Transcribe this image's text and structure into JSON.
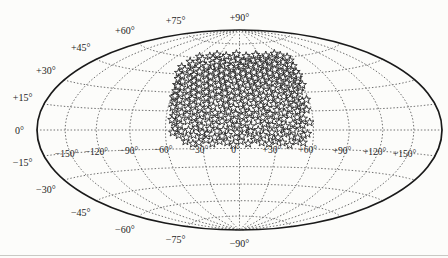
{
  "figure": {
    "background": "#fcfcfa",
    "bottom_rule_color": "#c9c9c4"
  },
  "chart_data": {
    "type": "scatter",
    "projection": "hammer-aitoff",
    "title": "",
    "xlabel": "",
    "ylabel": "",
    "lon_range_deg": [
      -180,
      180
    ],
    "lat_range_deg": [
      -90,
      90
    ],
    "grid": {
      "style": "dotted",
      "color": "#6f6f6f",
      "meridians_deg": [
        -150,
        -120,
        -90,
        -60,
        -30,
        0,
        30,
        60,
        90,
        120,
        150
      ],
      "parallels_deg": [
        -75,
        -60,
        -45,
        -30,
        -15,
        0,
        15,
        30,
        45,
        60,
        75
      ]
    },
    "outline": {
      "color": "#1a1a1a",
      "width": 1.7
    },
    "marker": {
      "shape": "open-star",
      "size_px": 9,
      "fill": "#ffffff",
      "stroke": "#1f1f1f"
    },
    "labels": {
      "latitude": [
        {
          "lat": 90,
          "text": "+90°"
        },
        {
          "lat": 75,
          "text": "+75°"
        },
        {
          "lat": 60,
          "text": "+60°"
        },
        {
          "lat": 45,
          "text": "+45°"
        },
        {
          "lat": 30,
          "text": "+30°"
        },
        {
          "lat": 15,
          "text": "+15°"
        },
        {
          "lat": 0,
          "text": "0°"
        },
        {
          "lat": -15,
          "text": "−15°"
        },
        {
          "lat": -30,
          "text": "−30°"
        },
        {
          "lat": -45,
          "text": "−45°"
        },
        {
          "lat": -60,
          "text": "−60°"
        },
        {
          "lat": -75,
          "text": "−75°"
        },
        {
          "lat": -90,
          "text": "−90°"
        }
      ],
      "longitude": [
        {
          "lon": -150,
          "text": "−150°"
        },
        {
          "lon": -120,
          "text": "−120°"
        },
        {
          "lon": -90,
          "text": "−90°"
        },
        {
          "lon": -60,
          "text": "−60°"
        },
        {
          "lon": -30,
          "text": "−30°"
        },
        {
          "lon": 0,
          "text": "0°"
        },
        {
          "lon": 30,
          "text": "+30°"
        },
        {
          "lon": 60,
          "text": "+60°"
        },
        {
          "lon": 90,
          "text": "+90°"
        },
        {
          "lon": 120,
          "text": "+120°"
        },
        {
          "lon": 150,
          "text": "+150°"
        }
      ]
    },
    "points_lon_lat_deg": [
      [
        -44,
        -9
      ],
      [
        -38,
        -11
      ],
      [
        -33,
        -10
      ],
      [
        -27,
        -8
      ],
      [
        -22,
        -11
      ],
      [
        -16,
        -9
      ],
      [
        -10,
        -10
      ],
      [
        -5,
        -12
      ],
      [
        1,
        -9
      ],
      [
        7,
        -11
      ],
      [
        12,
        -8
      ],
      [
        18,
        -10
      ],
      [
        24,
        -11
      ],
      [
        29,
        -9
      ],
      [
        35,
        -10
      ],
      [
        41,
        -12
      ],
      [
        46,
        -9
      ],
      [
        52,
        -10
      ],
      [
        -49,
        -4
      ],
      [
        -43,
        -6
      ],
      [
        -37,
        -4
      ],
      [
        -31,
        -5
      ],
      [
        -26,
        -3
      ],
      [
        -20,
        -6
      ],
      [
        -14,
        -5
      ],
      [
        -9,
        -4
      ],
      [
        -3,
        -6
      ],
      [
        2,
        -5
      ],
      [
        8,
        -3
      ],
      [
        14,
        -6
      ],
      [
        19,
        -4
      ],
      [
        25,
        -5
      ],
      [
        31,
        -6
      ],
      [
        36,
        -3
      ],
      [
        42,
        -5
      ],
      [
        47,
        -6
      ],
      [
        52,
        -4
      ],
      [
        -52,
        1
      ],
      [
        -47,
        -1
      ],
      [
        -41,
        0
      ],
      [
        -35,
        2
      ],
      [
        -30,
        -2
      ],
      [
        -24,
        1
      ],
      [
        -18,
        -1
      ],
      [
        -13,
        0
      ],
      [
        -7,
        2
      ],
      [
        -2,
        -2
      ],
      [
        4,
        1
      ],
      [
        9,
        -1
      ],
      [
        15,
        0
      ],
      [
        21,
        2
      ],
      [
        26,
        -2
      ],
      [
        32,
        1
      ],
      [
        38,
        -1
      ],
      [
        43,
        0
      ],
      [
        49,
        1
      ],
      [
        -53,
        6
      ],
      [
        -48,
        4
      ],
      [
        -42,
        7
      ],
      [
        -36,
        5
      ],
      [
        -31,
        3
      ],
      [
        -25,
        6
      ],
      [
        -19,
        4
      ],
      [
        -14,
        7
      ],
      [
        -8,
        5
      ],
      [
        -2,
        4
      ],
      [
        3,
        6
      ],
      [
        9,
        3
      ],
      [
        15,
        7
      ],
      [
        20,
        5
      ],
      [
        26,
        4
      ],
      [
        32,
        6
      ],
      [
        37,
        3
      ],
      [
        43,
        5
      ],
      [
        48,
        7
      ],
      [
        51,
        4
      ],
      [
        -54,
        11
      ],
      [
        -49,
        9
      ],
      [
        -43,
        12
      ],
      [
        -37,
        10
      ],
      [
        -32,
        8
      ],
      [
        -26,
        11
      ],
      [
        -20,
        9
      ],
      [
        -15,
        12
      ],
      [
        -9,
        10
      ],
      [
        -4,
        8
      ],
      [
        2,
        11
      ],
      [
        8,
        9
      ],
      [
        13,
        12
      ],
      [
        19,
        10
      ],
      [
        25,
        8
      ],
      [
        30,
        11
      ],
      [
        36,
        9
      ],
      [
        41,
        12
      ],
      [
        47,
        10
      ],
      [
        52,
        9
      ],
      [
        -54,
        16
      ],
      [
        -48,
        14
      ],
      [
        -43,
        17
      ],
      [
        -37,
        15
      ],
      [
        -31,
        13
      ],
      [
        -26,
        16
      ],
      [
        -20,
        14
      ],
      [
        -14,
        17
      ],
      [
        -9,
        15
      ],
      [
        -3,
        13
      ],
      [
        3,
        16
      ],
      [
        8,
        14
      ],
      [
        14,
        17
      ],
      [
        20,
        15
      ],
      [
        25,
        13
      ],
      [
        31,
        16
      ],
      [
        37,
        14
      ],
      [
        42,
        17
      ],
      [
        48,
        15
      ],
      [
        52,
        16
      ],
      [
        -56,
        21
      ],
      [
        -50,
        19
      ],
      [
        -45,
        22
      ],
      [
        -39,
        20
      ],
      [
        -33,
        18
      ],
      [
        -28,
        21
      ],
      [
        -22,
        19
      ],
      [
        -16,
        22
      ],
      [
        -11,
        20
      ],
      [
        -5,
        18
      ],
      [
        1,
        21
      ],
      [
        6,
        19
      ],
      [
        12,
        22
      ],
      [
        18,
        20
      ],
      [
        23,
        18
      ],
      [
        29,
        21
      ],
      [
        35,
        19
      ],
      [
        40,
        22
      ],
      [
        46,
        20
      ],
      [
        51,
        21
      ],
      [
        53,
        18
      ],
      [
        -58,
        26
      ],
      [
        -52,
        24
      ],
      [
        -46,
        27
      ],
      [
        -41,
        25
      ],
      [
        -35,
        23
      ],
      [
        -29,
        26
      ],
      [
        -24,
        24
      ],
      [
        -18,
        27
      ],
      [
        -12,
        25
      ],
      [
        -7,
        23
      ],
      [
        -1,
        26
      ],
      [
        5,
        24
      ],
      [
        10,
        27
      ],
      [
        16,
        25
      ],
      [
        22,
        23
      ],
      [
        27,
        26
      ],
      [
        33,
        24
      ],
      [
        39,
        27
      ],
      [
        44,
        25
      ],
      [
        50,
        26
      ],
      [
        54,
        23
      ],
      [
        -58,
        31
      ],
      [
        -53,
        29
      ],
      [
        -47,
        32
      ],
      [
        -41,
        30
      ],
      [
        -36,
        28
      ],
      [
        -30,
        31
      ],
      [
        -24,
        29
      ],
      [
        -19,
        32
      ],
      [
        -13,
        30
      ],
      [
        -7,
        28
      ],
      [
        -2,
        31
      ],
      [
        4,
        29
      ],
      [
        10,
        32
      ],
      [
        15,
        30
      ],
      [
        21,
        28
      ],
      [
        27,
        31
      ],
      [
        32,
        29
      ],
      [
        38,
        32
      ],
      [
        44,
        30
      ],
      [
        49,
        28
      ],
      [
        55,
        31
      ],
      [
        -60,
        36
      ],
      [
        -54,
        34
      ],
      [
        -48,
        37
      ],
      [
        -43,
        35
      ],
      [
        -37,
        33
      ],
      [
        -31,
        36
      ],
      [
        -26,
        34
      ],
      [
        -20,
        37
      ],
      [
        -14,
        35
      ],
      [
        -9,
        33
      ],
      [
        -3,
        36
      ],
      [
        3,
        34
      ],
      [
        8,
        37
      ],
      [
        14,
        35
      ],
      [
        20,
        33
      ],
      [
        25,
        36
      ],
      [
        31,
        34
      ],
      [
        37,
        37
      ],
      [
        42,
        35
      ],
      [
        48,
        33
      ],
      [
        53,
        36
      ],
      [
        57,
        34
      ],
      [
        -62,
        41
      ],
      [
        -56,
        39
      ],
      [
        -50,
        42
      ],
      [
        -45,
        40
      ],
      [
        -39,
        38
      ],
      [
        -33,
        41
      ],
      [
        -28,
        39
      ],
      [
        -22,
        42
      ],
      [
        -16,
        40
      ],
      [
        -11,
        38
      ],
      [
        -5,
        41
      ],
      [
        1,
        39
      ],
      [
        6,
        42
      ],
      [
        12,
        40
      ],
      [
        18,
        38
      ],
      [
        23,
        41
      ],
      [
        29,
        39
      ],
      [
        35,
        42
      ],
      [
        40,
        40
      ],
      [
        46,
        38
      ],
      [
        52,
        41
      ],
      [
        57,
        39
      ],
      [
        60,
        42
      ],
      [
        -66,
        46
      ],
      [
        -60,
        44
      ],
      [
        -54,
        47
      ],
      [
        -48,
        45
      ],
      [
        -42,
        43
      ],
      [
        -36,
        46
      ],
      [
        -30,
        44
      ],
      [
        -25,
        47
      ],
      [
        -19,
        45
      ],
      [
        -13,
        43
      ],
      [
        -7,
        46
      ],
      [
        -1,
        44
      ],
      [
        4,
        47
      ],
      [
        10,
        45
      ],
      [
        16,
        43
      ],
      [
        22,
        46
      ],
      [
        28,
        44
      ],
      [
        33,
        47
      ],
      [
        39,
        45
      ],
      [
        45,
        43
      ],
      [
        51,
        46
      ],
      [
        57,
        44
      ],
      [
        62,
        47
      ],
      [
        -68,
        51
      ],
      [
        -62,
        49
      ],
      [
        -56,
        52
      ],
      [
        -50,
        50
      ],
      [
        -44,
        48
      ],
      [
        -38,
        51
      ],
      [
        -32,
        49
      ],
      [
        -26,
        52
      ],
      [
        -20,
        50
      ],
      [
        -14,
        48
      ],
      [
        -8,
        51
      ],
      [
        -2,
        49
      ],
      [
        4,
        52
      ],
      [
        10,
        50
      ],
      [
        16,
        48
      ],
      [
        22,
        51
      ],
      [
        28,
        49
      ],
      [
        34,
        52
      ],
      [
        40,
        50
      ],
      [
        46,
        48
      ],
      [
        52,
        51
      ],
      [
        58,
        49
      ],
      [
        64,
        52
      ],
      [
        -64,
        56
      ],
      [
        -58,
        54
      ],
      [
        -52,
        57
      ],
      [
        -46,
        55
      ],
      [
        -40,
        53
      ],
      [
        -34,
        56
      ],
      [
        -28,
        54
      ],
      [
        -22,
        57
      ],
      [
        -16,
        55
      ],
      [
        -10,
        53
      ],
      [
        -4,
        56
      ],
      [
        2,
        54
      ],
      [
        8,
        57
      ],
      [
        14,
        55
      ],
      [
        20,
        53
      ],
      [
        26,
        56
      ],
      [
        32,
        54
      ],
      [
        38,
        57
      ],
      [
        44,
        55
      ],
      [
        50,
        53
      ],
      [
        56,
        56
      ],
      [
        62,
        54
      ],
      [
        67,
        57
      ],
      [
        -58,
        61
      ],
      [
        -51,
        59
      ],
      [
        -44,
        62
      ],
      [
        -37,
        60
      ],
      [
        -30,
        58
      ],
      [
        -23,
        61
      ],
      [
        -16,
        59
      ],
      [
        -9,
        62
      ],
      [
        -2,
        60
      ],
      [
        5,
        58
      ],
      [
        12,
        61
      ],
      [
        19,
        59
      ],
      [
        26,
        62
      ],
      [
        33,
        60
      ],
      [
        40,
        58
      ],
      [
        47,
        61
      ],
      [
        54,
        59
      ],
      [
        61,
        62
      ],
      [
        68,
        60
      ],
      [
        -35,
        64
      ],
      [
        -20,
        63
      ],
      [
        -5,
        65
      ],
      [
        10,
        63
      ],
      [
        25,
        64
      ],
      [
        40,
        63
      ],
      [
        55,
        64
      ],
      [
        -56,
        18
      ],
      [
        -57,
        27
      ],
      [
        -55,
        8
      ],
      [
        -54,
        -2
      ],
      [
        -58,
        35
      ],
      [
        56,
        16
      ],
      [
        57,
        6
      ],
      [
        55,
        -3
      ],
      [
        58,
        24
      ],
      [
        60,
        36
      ],
      [
        62,
        44
      ]
    ]
  }
}
